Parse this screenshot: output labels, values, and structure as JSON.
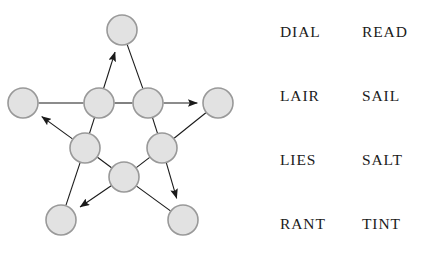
{
  "figure": {
    "name": "pentagram-word-graph",
    "background_color": "#ffffff"
  },
  "graph": {
    "node_fill": "#e2e2e2",
    "node_stroke": "#999999",
    "node_radius": 15,
    "edge_color": "#1a1a1a",
    "edge_width": 1.1,
    "nodes": [
      {
        "id": "top",
        "label": "",
        "cx": 122,
        "cy": 30,
        "ring": "outer"
      },
      {
        "id": "left",
        "label": "",
        "cx": 23,
        "cy": 103,
        "ring": "outer"
      },
      {
        "id": "right",
        "label": "",
        "cx": 218,
        "cy": 103,
        "ring": "outer"
      },
      {
        "id": "bottom-left",
        "label": "",
        "cx": 61,
        "cy": 220,
        "ring": "outer"
      },
      {
        "id": "bottom-right",
        "label": "",
        "cx": 183,
        "cy": 220,
        "ring": "outer"
      },
      {
        "id": "inner-upper-left",
        "label": "",
        "cx": 99,
        "cy": 103,
        "ring": "inner"
      },
      {
        "id": "inner-upper-right",
        "label": "",
        "cx": 148,
        "cy": 103,
        "ring": "inner"
      },
      {
        "id": "inner-lower-left",
        "label": "",
        "cx": 85,
        "cy": 148,
        "ring": "inner"
      },
      {
        "id": "inner-lower-right",
        "label": "",
        "cx": 162,
        "cy": 148,
        "ring": "inner"
      },
      {
        "id": "inner-bottom",
        "label": "",
        "cx": 124,
        "cy": 177,
        "ring": "inner"
      }
    ],
    "edges": [
      {
        "from": "inner-upper-left",
        "to": "top",
        "arrow": true
      },
      {
        "from": "top",
        "to": "inner-upper-right",
        "arrow": false
      },
      {
        "from": "left",
        "to": "inner-upper-left",
        "arrow": false
      },
      {
        "from": "inner-upper-left",
        "to": "inner-upper-right",
        "arrow": false
      },
      {
        "from": "inner-upper-right",
        "to": "right",
        "arrow": true
      },
      {
        "from": "inner-lower-left",
        "to": "left",
        "arrow": true
      },
      {
        "from": "inner-upper-left",
        "to": "inner-lower-left",
        "arrow": false
      },
      {
        "from": "inner-upper-right",
        "to": "inner-lower-right",
        "arrow": false
      },
      {
        "from": "inner-lower-right",
        "to": "right",
        "arrow": false
      },
      {
        "from": "inner-lower-left",
        "to": "bottom-left",
        "arrow": false
      },
      {
        "from": "inner-lower-left",
        "to": "inner-bottom",
        "arrow": false
      },
      {
        "from": "inner-bottom",
        "to": "inner-lower-right",
        "arrow": false
      },
      {
        "from": "inner-bottom",
        "to": "bottom-left",
        "arrow": true
      },
      {
        "from": "inner-lower-right",
        "to": "bottom-right",
        "arrow": true
      },
      {
        "from": "inner-bottom",
        "to": "bottom-right",
        "arrow": false
      }
    ]
  },
  "word_list": {
    "columns": 2,
    "rows": [
      {
        "cells": [
          "DIAL",
          "READ"
        ]
      },
      {
        "cells": [
          "LAIR",
          "SAIL"
        ]
      },
      {
        "cells": [
          "LIES",
          "SALT"
        ]
      },
      {
        "cells": [
          "RANT",
          "TINT"
        ]
      }
    ],
    "row_y": [
      20,
      84,
      148,
      212
    ]
  }
}
